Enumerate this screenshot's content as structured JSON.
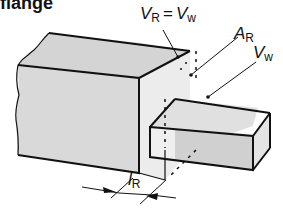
{
  "title": "flange",
  "labels": {
    "vr_eq_vw": {
      "v1": "V",
      "s1": "R",
      "eq": "=",
      "v2": "V",
      "s2": "w"
    },
    "ar": {
      "v": "A",
      "s": "R"
    },
    "vw": {
      "v": "V",
      "s": "w"
    },
    "lr": {
      "v": "l",
      "s": "R"
    }
  },
  "colors": {
    "outline": "#111111",
    "block_face": "#d9d9d9",
    "block_top": "#d4d4d4",
    "flange_face": "#ececec",
    "flange_side": "#e4e4e4",
    "stub_face": "#d0d0d0",
    "stub_light": "#efefef"
  }
}
